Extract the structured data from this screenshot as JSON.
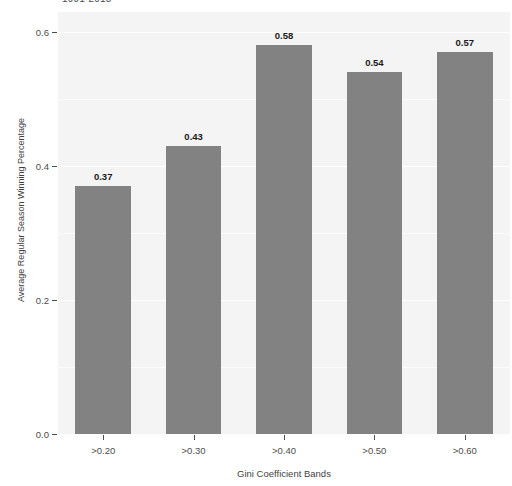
{
  "chart_data": {
    "type": "bar",
    "title": "1991-2018",
    "xlabel": "Gini Coefficient Bands",
    "ylabel": "Average Regular Season Winning Percentage",
    "categories": [
      ">0.20",
      ">0.30",
      ">0.40",
      ">0.50",
      ">0.60"
    ],
    "values": [
      0.37,
      0.43,
      0.58,
      0.54,
      0.57
    ],
    "bar_labels": [
      "0.37",
      "0.43",
      "0.58",
      "0.54",
      "0.57"
    ],
    "ylim": [
      0.0,
      0.63
    ],
    "ytick_values": [
      0.0,
      0.2,
      0.4,
      0.6
    ],
    "ytick_labels": [
      "0.0",
      "0.2",
      "0.4",
      "0.6"
    ],
    "grid": true,
    "legend": "none",
    "bar_color": "#828282",
    "panel_color": "#f4f4f4",
    "gridline_color": "#ffffff",
    "text_color": "#4d4d4d"
  }
}
